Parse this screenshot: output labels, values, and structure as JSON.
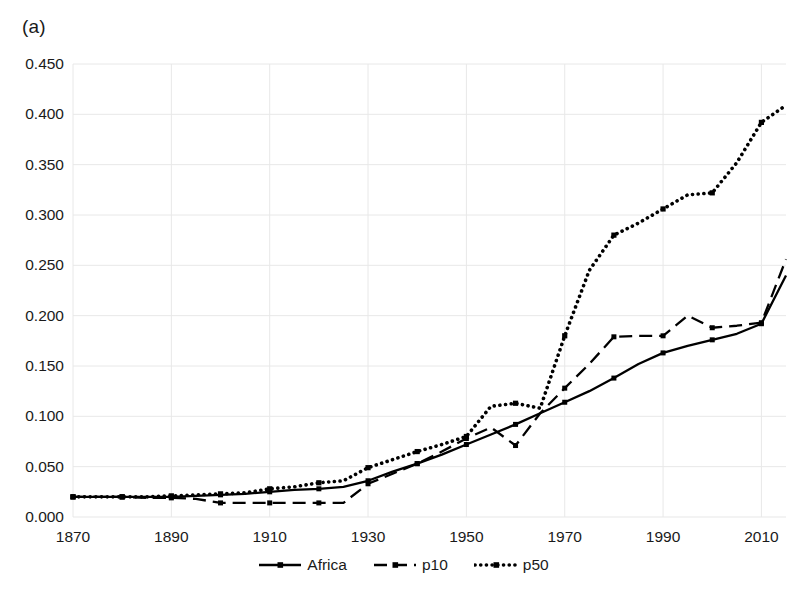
{
  "panel": {
    "label": "(a)"
  },
  "legend": {
    "position": "bottom-center",
    "items": [
      {
        "label": "Africa",
        "style": "solid-with-markers",
        "swatch": "legend-swatch-africa"
      },
      {
        "label": "p10",
        "style": "dashed-with-markers",
        "swatch": "legend-swatch-p10"
      },
      {
        "label": "p50",
        "style": "dotted-with-markers",
        "swatch": "legend-swatch-p50"
      }
    ]
  },
  "axes": {
    "y_ticks": [
      "0.450",
      "0.400",
      "0.350",
      "0.300",
      "0.250",
      "0.200",
      "0.150",
      "0.100",
      "0.050",
      "0.000"
    ],
    "x_ticks": [
      "1870",
      "1890",
      "1910",
      "1930",
      "1950",
      "1970",
      "1990",
      "2010"
    ]
  },
  "colors": {
    "series": "#000000",
    "grid": "#e8e8e8",
    "text": "#1a1a1a",
    "background": "#ffffff"
  },
  "chart_data": {
    "type": "line",
    "title": "(a)",
    "xlabel": "",
    "ylabel": "",
    "xlim": [
      1870,
      2015
    ],
    "ylim": [
      0.0,
      0.45
    ],
    "grid": true,
    "legend_position": "bottom-center",
    "x": [
      1870,
      1875,
      1880,
      1885,
      1890,
      1895,
      1900,
      1905,
      1910,
      1915,
      1920,
      1925,
      1930,
      1935,
      1940,
      1945,
      1950,
      1955,
      1960,
      1965,
      1970,
      1975,
      1980,
      1985,
      1990,
      1995,
      2000,
      2005,
      2010,
      2015
    ],
    "series": [
      {
        "name": "Africa",
        "style": "solid",
        "values": [
          0.02,
          0.02,
          0.02,
          0.02,
          0.02,
          0.021,
          0.022,
          0.023,
          0.025,
          0.027,
          0.028,
          0.03,
          0.036,
          0.045,
          0.053,
          0.062,
          0.072,
          0.082,
          0.092,
          0.103,
          0.114,
          0.125,
          0.138,
          0.152,
          0.163,
          0.17,
          0.176,
          0.182,
          0.192,
          0.24
        ]
      },
      {
        "name": "p10",
        "style": "dashed",
        "values": [
          0.02,
          0.02,
          0.02,
          0.019,
          0.019,
          0.018,
          0.014,
          0.014,
          0.014,
          0.014,
          0.014,
          0.014,
          0.033,
          0.043,
          0.053,
          0.065,
          0.078,
          0.089,
          0.071,
          0.103,
          0.128,
          0.152,
          0.179,
          0.18,
          0.18,
          0.2,
          0.188,
          0.19,
          0.193,
          0.256
        ]
      },
      {
        "name": "p50",
        "style": "dotted",
        "values": [
          0.02,
          0.02,
          0.02,
          0.02,
          0.021,
          0.022,
          0.023,
          0.024,
          0.028,
          0.03,
          0.034,
          0.036,
          0.049,
          0.057,
          0.065,
          0.072,
          0.08,
          0.11,
          0.113,
          0.108,
          0.18,
          0.245,
          0.28,
          0.292,
          0.306,
          0.32,
          0.322,
          0.352,
          0.392,
          0.409
        ]
      }
    ]
  }
}
